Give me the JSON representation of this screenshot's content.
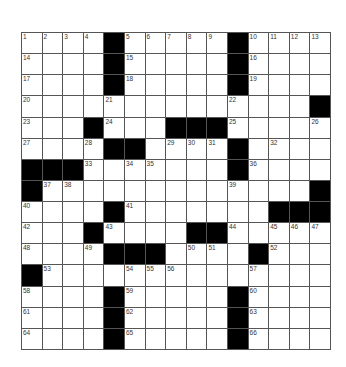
{
  "puzzle": {
    "rows": 15,
    "cols": 15,
    "layout": [
      "....#.....#....",
      "....#.....#....",
      "....#.....#....",
      "..............#",
      "...#...###.....",
      "....##....#....",
      "###.......#....",
      "#.............#",
      "....#.......###",
      "...#....##.....",
      "....###....#...",
      "#..............",
      "....#.....#....",
      "....#.....#....",
      "....#.....#...."
    ],
    "numbers": [
      [
        0,
        0,
        1
      ],
      [
        0,
        1,
        2
      ],
      [
        0,
        2,
        3
      ],
      [
        0,
        3,
        4
      ],
      [
        0,
        5,
        5
      ],
      [
        0,
        6,
        6
      ],
      [
        0,
        7,
        7
      ],
      [
        0,
        8,
        8
      ],
      [
        0,
        9,
        9
      ],
      [
        0,
        11,
        10
      ],
      [
        0,
        12,
        11
      ],
      [
        0,
        13,
        12
      ],
      [
        0,
        14,
        13
      ],
      [
        1,
        0,
        14
      ],
      [
        1,
        5,
        15
      ],
      [
        1,
        11,
        16
      ],
      [
        2,
        0,
        17
      ],
      [
        2,
        5,
        18
      ],
      [
        2,
        11,
        19
      ],
      [
        3,
        0,
        20
      ],
      [
        3,
        4,
        21
      ],
      [
        3,
        10,
        22
      ],
      [
        4,
        0,
        23
      ],
      [
        4,
        4,
        24
      ],
      [
        4,
        10,
        25
      ],
      [
        4,
        14,
        26
      ],
      [
        5,
        0,
        27
      ],
      [
        5,
        3,
        28
      ],
      [
        5,
        7,
        29
      ],
      [
        5,
        8,
        30
      ],
      [
        5,
        9,
        31
      ],
      [
        5,
        12,
        32
      ],
      [
        6,
        3,
        33
      ],
      [
        6,
        5,
        34
      ],
      [
        6,
        6,
        35
      ],
      [
        6,
        11,
        36
      ],
      [
        7,
        1,
        37
      ],
      [
        7,
        2,
        38
      ],
      [
        7,
        10,
        39
      ],
      [
        8,
        0,
        40
      ],
      [
        8,
        5,
        41
      ],
      [
        9,
        0,
        42
      ],
      [
        9,
        4,
        43
      ],
      [
        9,
        10,
        44
      ],
      [
        9,
        12,
        45
      ],
      [
        9,
        13,
        46
      ],
      [
        9,
        14,
        47
      ],
      [
        10,
        0,
        48
      ],
      [
        10,
        3,
        49
      ],
      [
        10,
        8,
        50
      ],
      [
        10,
        9,
        51
      ],
      [
        10,
        12,
        52
      ],
      [
        11,
        1,
        53
      ],
      [
        11,
        5,
        54
      ],
      [
        11,
        6,
        55
      ],
      [
        11,
        7,
        56
      ],
      [
        11,
        11,
        57
      ],
      [
        12,
        0,
        58
      ],
      [
        12,
        5,
        59
      ],
      [
        12,
        11,
        60
      ],
      [
        13,
        0,
        61
      ],
      [
        13,
        5,
        62
      ],
      [
        13,
        11,
        63
      ],
      [
        14,
        0,
        64
      ],
      [
        14,
        5,
        65
      ],
      [
        14,
        11,
        66
      ]
    ]
  }
}
